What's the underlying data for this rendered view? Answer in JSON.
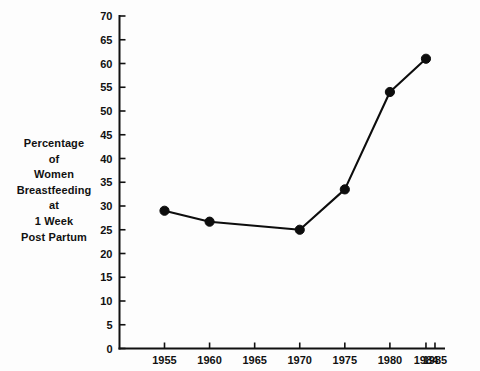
{
  "chart_data": {
    "type": "line",
    "title": "",
    "xlabel": "",
    "ylabel": "Percentage of Women Breastfeeding at 1 Week Post Partum",
    "x": [
      1955,
      1960,
      1970,
      1975,
      1980,
      1984
    ],
    "values": [
      29,
      26.7,
      25,
      33.5,
      54,
      61
    ],
    "series": [
      {
        "name": "Percentage of Women Breastfeeding at 1 Week Post Partum",
        "x": [
          1955,
          1960,
          1970,
          1975,
          1980,
          1984
        ],
        "values": [
          29,
          26.7,
          25,
          33.5,
          54,
          61
        ]
      }
    ],
    "xlim": [
      1952,
      1985
    ],
    "ylim": [
      0,
      70
    ],
    "x_ticks": [
      1955,
      1960,
      1965,
      1970,
      1975,
      1980,
      1984,
      1985
    ],
    "x_tick_labels": [
      "1955",
      "1960",
      "1965",
      "1970",
      "1975",
      "1980",
      "1984",
      "1985"
    ],
    "y_ticks": [
      0,
      5,
      10,
      15,
      20,
      25,
      30,
      35,
      40,
      45,
      50,
      55,
      60,
      65,
      70
    ],
    "y_tick_labels": [
      "0",
      "5",
      "10",
      "15",
      "20",
      "25",
      "30",
      "35",
      "40",
      "45",
      "50",
      "55",
      "60",
      "65",
      "70"
    ],
    "grid": false,
    "legend": false,
    "legend_position": "none",
    "marker": "filled-circle",
    "line_color": "#0d0d0d",
    "marker_color": "#0d0d0d",
    "background_color": "#fdfdfd",
    "axis_color": "#111111"
  },
  "ylabel_lines": [
    "Percentage",
    "of",
    "Women",
    "Breastfeeding",
    "at",
    "1 Week",
    "Post Partum"
  ]
}
